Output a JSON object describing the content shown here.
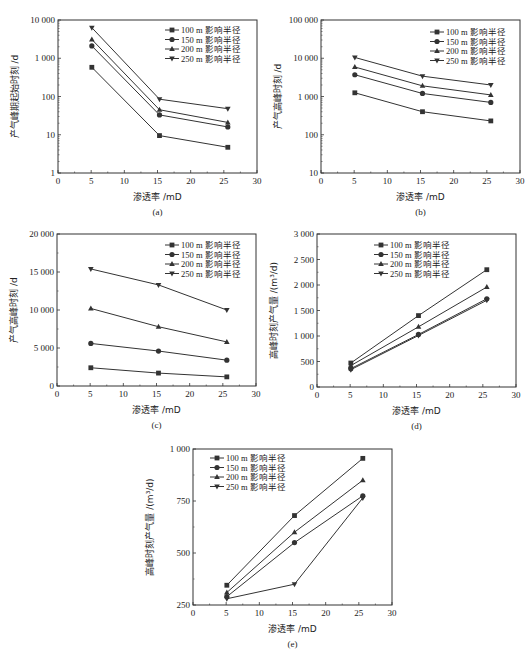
{
  "figure": {
    "legend_entries": [
      "100 m 影响半径",
      "150 m 影响半径",
      "200 m 影响半径",
      "250 m 影响半径"
    ],
    "markers": [
      "square",
      "circle",
      "triangle-up",
      "triangle-down"
    ],
    "line_color": "#333333"
  },
  "chart_data": [
    {
      "id": "a",
      "type": "line",
      "panel_label": "(a)",
      "title": "",
      "xlabel": "渗透率 /mD",
      "ylabel": "产气峰期起始时刻 /d",
      "yscale": "log",
      "xlim": [
        0,
        30
      ],
      "ylim": [
        1,
        10000
      ],
      "xticks": [
        0,
        5,
        10,
        15,
        20,
        25,
        30
      ],
      "yticks": [
        1,
        10,
        100,
        1000,
        10000
      ],
      "ytick_labels": [
        "1",
        "10",
        "100",
        "1 000",
        "10 000"
      ],
      "grid": false,
      "legend_position": "upper right",
      "x": [
        5.1,
        15.3,
        25.6
      ],
      "series": [
        {
          "name": "100 m 影响半径",
          "values": [
            580,
            9.5,
            4.7
          ]
        },
        {
          "name": "150 m 影响半径",
          "values": [
            2100,
            33,
            16
          ]
        },
        {
          "name": "200 m 影响半径",
          "values": [
            3100,
            45,
            21
          ]
        },
        {
          "name": "250 m 影响半径",
          "values": [
            6300,
            85,
            48
          ]
        }
      ]
    },
    {
      "id": "b",
      "type": "line",
      "panel_label": "(b)",
      "title": "",
      "xlabel": "渗透率 /mD",
      "ylabel": "产气高峰时刻 /d",
      "yscale": "log",
      "xlim": [
        0,
        30
      ],
      "ylim": [
        10,
        100000
      ],
      "xticks": [
        0,
        5,
        10,
        15,
        20,
        25,
        30
      ],
      "yticks": [
        10,
        100,
        1000,
        10000,
        100000
      ],
      "ytick_labels": [
        "10",
        "100",
        "1 000",
        "10 000",
        "100 000"
      ],
      "grid": false,
      "legend_position": "upper right",
      "x": [
        5.1,
        15.3,
        25.6
      ],
      "series": [
        {
          "name": "100 m 影响半径",
          "values": [
            1250,
            400,
            230
          ]
        },
        {
          "name": "150 m 影响半径",
          "values": [
            3700,
            1200,
            700
          ]
        },
        {
          "name": "200 m 影响半径",
          "values": [
            5900,
            1900,
            1100
          ]
        },
        {
          "name": "250 m 影响半径",
          "values": [
            10500,
            3400,
            2000
          ]
        }
      ]
    },
    {
      "id": "c",
      "type": "line",
      "panel_label": "(c)",
      "title": "",
      "xlabel": "渗透率 /mD",
      "ylabel": "产气高峰时刻 /d",
      "yscale": "linear",
      "xlim": [
        0,
        30
      ],
      "ylim": [
        0,
        20000
      ],
      "xticks": [
        0,
        5,
        10,
        15,
        20,
        25,
        30
      ],
      "yticks": [
        0,
        5000,
        10000,
        15000,
        20000
      ],
      "ytick_labels": [
        "0",
        "5 000",
        "10 000",
        "15 000",
        "20 000"
      ],
      "grid": false,
      "legend_position": "upper right",
      "x": [
        5.1,
        15.3,
        25.6
      ],
      "series": [
        {
          "name": "100 m 影响半径",
          "values": [
            2400,
            1700,
            1200
          ]
        },
        {
          "name": "150 m 影响半径",
          "values": [
            5600,
            4600,
            3400
          ]
        },
        {
          "name": "200 m 影响半径",
          "values": [
            10200,
            7800,
            5800
          ]
        },
        {
          "name": "250 m 影响半径",
          "values": [
            15400,
            13300,
            10000
          ]
        }
      ]
    },
    {
      "id": "d",
      "type": "line",
      "panel_label": "(d)",
      "title": "",
      "xlabel": "渗透率 /mD",
      "ylabel": "高峰时刻产气量 /(m³/d)",
      "yscale": "linear",
      "xlim": [
        0,
        30
      ],
      "ylim": [
        0,
        3000
      ],
      "xticks": [
        0,
        5,
        10,
        15,
        20,
        25,
        30
      ],
      "yticks": [
        0,
        500,
        1000,
        1500,
        2000,
        2500,
        3000
      ],
      "ytick_labels": [
        "0",
        "500",
        "1 000",
        "1 500",
        "2 000",
        "2 500",
        "3 000"
      ],
      "grid": false,
      "legend_position": "upper center",
      "x": [
        5.1,
        15.3,
        25.6
      ],
      "series": [
        {
          "name": "100 m 影响半径",
          "values": [
            470,
            1400,
            2300
          ]
        },
        {
          "name": "150 m 影响半径",
          "values": [
            360,
            1030,
            1730
          ]
        },
        {
          "name": "200 m 影响半径",
          "values": [
            420,
            1180,
            1960
          ]
        },
        {
          "name": "250 m 影响半径",
          "values": [
            340,
            1010,
            1700
          ]
        }
      ]
    },
    {
      "id": "e",
      "type": "line",
      "panel_label": "(e)",
      "title": "",
      "xlabel": "渗透率 /mD",
      "ylabel": "高峰时刻产气量 /(m³/d)",
      "yscale": "linear",
      "xlim": [
        0,
        30
      ],
      "ylim": [
        250,
        1000
      ],
      "xticks": [
        0,
        5,
        10,
        15,
        20,
        25,
        30
      ],
      "yticks": [
        250,
        500,
        750,
        1000
      ],
      "ytick_labels": [
        "250",
        "500",
        "750",
        "1 000"
      ],
      "grid": false,
      "legend_position": "upper left",
      "x": [
        5.1,
        15.3,
        25.6
      ],
      "series": [
        {
          "name": "100 m 影响半径",
          "values": [
            345,
            680,
            955
          ]
        },
        {
          "name": "150 m 影响半径",
          "values": [
            290,
            550,
            775
          ]
        },
        {
          "name": "200 m 影响半径",
          "values": [
            310,
            600,
            850
          ]
        },
        {
          "name": "250 m 影响半径",
          "values": [
            280,
            350,
            765
          ]
        }
      ]
    }
  ],
  "layout": {
    "panels": {
      "a": {
        "x0": 58,
        "x1": 257,
        "y0": 20,
        "y1": 173,
        "legend": {
          "x": 165,
          "y": 30
        }
      },
      "b": {
        "x0": 321,
        "x1": 520,
        "y0": 20,
        "y1": 173,
        "legend": {
          "x": 430,
          "y": 32
        }
      },
      "c": {
        "x0": 57,
        "x1": 256,
        "y0": 234,
        "y1": 386,
        "legend": {
          "x": 165,
          "y": 245
        }
      },
      "d": {
        "x0": 317,
        "x1": 516,
        "y0": 234,
        "y1": 387,
        "legend": {
          "x": 374,
          "y": 245
        }
      },
      "e": {
        "x0": 193,
        "x1": 392,
        "y0": 449,
        "y1": 605,
        "legend": {
          "x": 210,
          "y": 458
        }
      }
    }
  }
}
